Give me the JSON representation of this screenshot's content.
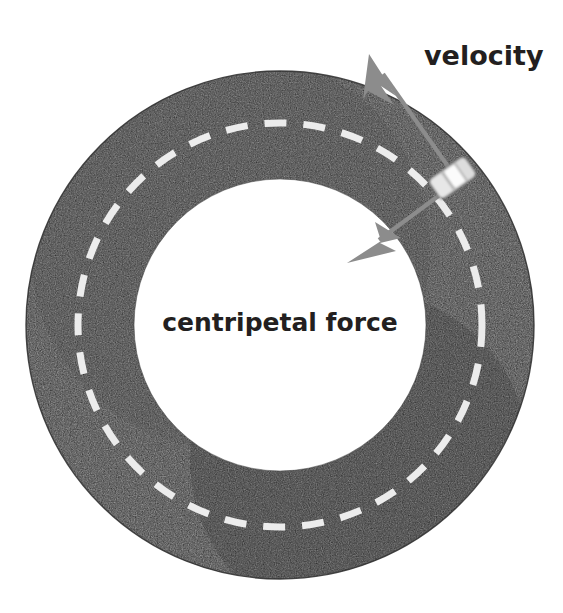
{
  "figure": {
    "background_color": "#ffffff"
  },
  "track": {
    "name": "circular-road",
    "asphalt_color": "#2b2b2b",
    "asphalt_highlight_color": "#6d6d6d",
    "center_x": 280,
    "center_y": 325,
    "outer_radius": 254,
    "inner_radius": 146,
    "lane_marking": {
      "name": "dashed-center-line",
      "color": "#ececec",
      "radius": 202,
      "dash_length": 22,
      "gap_length": 17,
      "thickness": 7
    }
  },
  "car": {
    "name": "car-on-track",
    "body_color": "#d9d9d9",
    "roof_color": "#f2f2f2",
    "outline_color": "#5a5a5a",
    "center_x": 452,
    "center_y": 177,
    "rotation_deg": -35,
    "length": 46,
    "width": 26
  },
  "arrows": [
    {
      "name": "velocity-arrow",
      "label": "velocity",
      "color": "#8c8c8c",
      "from_x": 452,
      "from_y": 172,
      "to_x": 369,
      "to_y": 54,
      "shaft_width": 4,
      "head_length": 40,
      "head_width": 26
    },
    {
      "name": "centripetal-force-arrow",
      "label": "centripetal force",
      "color": "#8c8c8c",
      "from_x": 457,
      "from_y": 182,
      "to_x": 347,
      "to_y": 263,
      "shaft_width": 4,
      "head_length": 40,
      "head_width": 26
    }
  ],
  "labels": {
    "velocity": {
      "name": "velocity-label",
      "text": "velocity",
      "x": 424,
      "y": 65,
      "font_size": 27,
      "color": "#231f20",
      "anchor": "start"
    },
    "centripetal_force": {
      "name": "centripetal-force-label",
      "text": "centripetal force",
      "x": 280,
      "y": 331,
      "font_size": 25,
      "color": "#231f20",
      "anchor": "middle"
    }
  }
}
